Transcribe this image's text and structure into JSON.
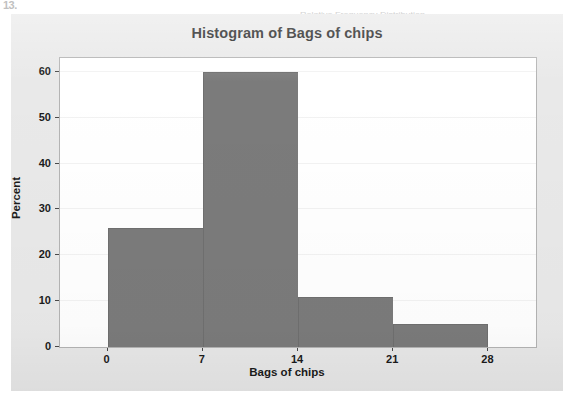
{
  "page": {
    "page_number": "13.",
    "ghost_text": "Relative Frequency Distribution"
  },
  "chart_data": {
    "type": "bar",
    "title": "Histogram of Bags of chips",
    "xlabel": "Bags of chips",
    "ylabel": "Percent",
    "grid": true,
    "legend": "none",
    "bin_width": 7,
    "bin_edges": [
      0,
      7,
      14,
      21,
      28
    ],
    "categories": [
      "0-7",
      "7-14",
      "14-21",
      "21-28"
    ],
    "values": [
      26,
      60,
      11,
      5
    ],
    "xlim": [
      -3.5,
      31.5
    ],
    "ylim": [
      0,
      63
    ],
    "xticks": [
      0,
      7,
      14,
      21,
      28
    ],
    "xtick_labels": [
      "0",
      "7",
      "14",
      "21",
      "28"
    ],
    "yticks": [
      0,
      10,
      20,
      30,
      40,
      50,
      60
    ],
    "ytick_labels": [
      "0",
      "10",
      "20",
      "30",
      "40",
      "50",
      "60"
    ],
    "bar_color": "#7b7b7b",
    "plot_background": "#ffffff",
    "figure_background": "#e9e9e9"
  }
}
